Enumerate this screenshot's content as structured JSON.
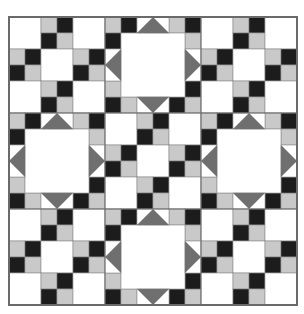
{
  "quilt": {
    "grid_cells": 18,
    "cell_px": 16,
    "blocks_per_side": 3,
    "block_cells": 6,
    "block_layout": [
      [
        "chain",
        "star",
        "chain"
      ],
      [
        "star",
        "chain",
        "star"
      ],
      [
        "chain",
        "star",
        "chain"
      ]
    ],
    "colors": {
      "background": "#ffffff",
      "dark": "#1c1c1c",
      "light": "#c9c9c9",
      "triangle": "#6f6f6f",
      "grid_line": "#8a8a8a",
      "border": "#6a6a6a"
    }
  }
}
